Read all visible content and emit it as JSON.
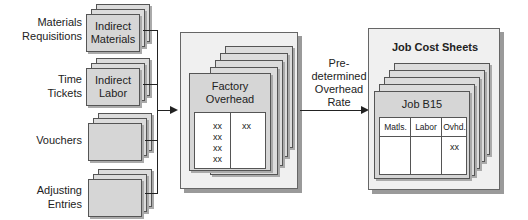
{
  "sources": [
    {
      "label": "Materials\nRequisitions",
      "line1": "Materials",
      "line2": "Requisitions",
      "doc_line1": "Indirect",
      "doc_line2": "Materials"
    },
    {
      "label": "Time\nTickets",
      "line1": "Time",
      "line2": "Tickets",
      "doc_line1": "Indirect",
      "doc_line2": "Labor"
    },
    {
      "label": "Vouchers",
      "line1": "Vouchers",
      "line2": "",
      "doc_line1": "",
      "doc_line2": ""
    },
    {
      "label": "Adjusting\nEntries",
      "line1": "Adjusting",
      "line2": "Entries",
      "doc_line1": "",
      "doc_line2": ""
    }
  ],
  "factory_overhead": {
    "title_line1": "Factory",
    "title_line2": "Overhead",
    "debits": [
      "xx",
      "xx",
      "xx",
      "xx"
    ],
    "credits": [
      "xx"
    ]
  },
  "arrow_label": {
    "line1": "Pre-",
    "line2": "determined",
    "line3": "Overhead",
    "line4": "Rate"
  },
  "job_cost_sheets": {
    "title": "Job Cost Sheets",
    "job_title": "Job B15",
    "columns": [
      "Matls.",
      "Labor",
      "Ovhd."
    ],
    "values": [
      "",
      "",
      "xx"
    ]
  },
  "colors": {
    "doc_fill": "#d6d6d6",
    "panel_fill": "#f0f0f0",
    "line": "#222222"
  }
}
